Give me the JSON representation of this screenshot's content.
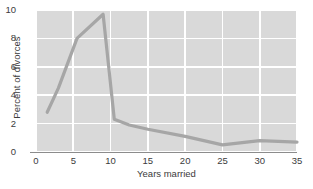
{
  "chart_data": {
    "type": "line",
    "title": "",
    "xlabel": "Years married",
    "ylabel": "Percent of divorces",
    "xlim": [
      0,
      35
    ],
    "ylim": [
      0,
      10
    ],
    "grid": true,
    "legend": false,
    "line_color": "#a6a6a6",
    "plot_background": "#d9d9d9",
    "gridline_color": "#ffffff",
    "text_color": "#3b3b3b",
    "xticks": [
      0,
      5,
      10,
      15,
      20,
      25,
      30,
      35
    ],
    "xtick_labels": [
      "0",
      "5",
      "10",
      "15",
      "20",
      "25",
      "30",
      "35"
    ],
    "yticks": [
      0,
      2,
      4,
      6,
      8,
      10
    ],
    "ytick_labels": [
      "0",
      "2",
      "4",
      "6",
      "8",
      "10"
    ],
    "series": [
      {
        "name": "Percent of divorces",
        "x": [
          1.5,
          3.0,
          5.5,
          9.0,
          10.5,
          12.5,
          15.0,
          20.0,
          25.0,
          30.0,
          35.0
        ],
        "y": [
          2.8,
          4.5,
          8.0,
          9.7,
          2.3,
          1.9,
          1.6,
          1.1,
          0.5,
          0.8,
          0.7
        ]
      }
    ]
  }
}
